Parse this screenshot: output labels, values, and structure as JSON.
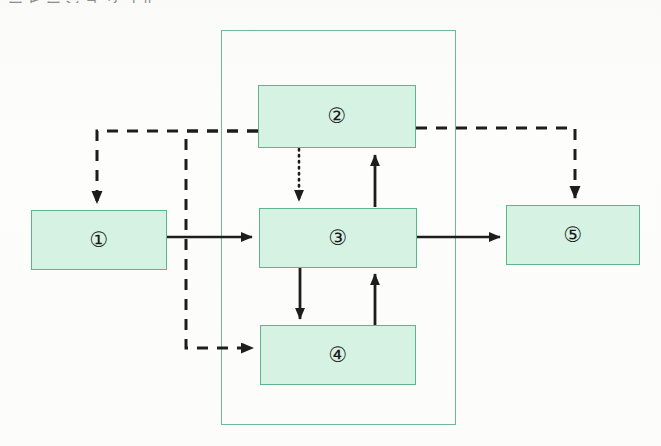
{
  "page": {
    "width": 661,
    "height": 446,
    "background_color": "#fbfbfa",
    "clipped_top_text": "ーヒージョンゴル、"
  },
  "palette": {
    "node_fill": "#d6f2e2",
    "node_border": "#5eb58c",
    "container_border": "#6fb795",
    "arrow_color": "#1d1d1d",
    "background": "#fbfbfa"
  },
  "diagram": {
    "type": "block-flow-diagram",
    "container": {
      "name": "system-boundary",
      "x": 221,
      "y": 30,
      "width": 235,
      "height": 395,
      "style": "solid-thin-green-outline",
      "fill": "none"
    },
    "nodes": [
      {
        "id": "n1",
        "label": "①",
        "number": 1,
        "x": 31,
        "y": 210,
        "width": 136,
        "height": 60
      },
      {
        "id": "n2",
        "label": "②",
        "number": 2,
        "x": 258,
        "y": 85,
        "width": 158,
        "height": 63
      },
      {
        "id": "n3",
        "label": "③",
        "number": 3,
        "x": 259,
        "y": 208,
        "width": 158,
        "height": 60
      },
      {
        "id": "n4",
        "label": "④",
        "number": 4,
        "x": 260,
        "y": 325,
        "width": 156,
        "height": 60
      },
      {
        "id": "n5",
        "label": "⑤",
        "number": 5,
        "x": 506,
        "y": 205,
        "width": 134,
        "height": 60
      }
    ],
    "edges": [
      {
        "id": "e1",
        "from": "n1",
        "to": "n3",
        "style": "solid",
        "direction": "right",
        "label": ""
      },
      {
        "id": "e2",
        "from": "n3",
        "to": "n5",
        "style": "solid",
        "direction": "right",
        "label": ""
      },
      {
        "id": "e3",
        "from": "n2",
        "to": "n3",
        "style": "dotted",
        "direction": "down",
        "label": ""
      },
      {
        "id": "e4",
        "from": "n3",
        "to": "n2",
        "style": "solid",
        "direction": "up",
        "label": ""
      },
      {
        "id": "e5",
        "from": "n3",
        "to": "n4",
        "style": "solid",
        "direction": "down",
        "label": ""
      },
      {
        "id": "e6",
        "from": "n4",
        "to": "n3",
        "style": "solid",
        "direction": "up",
        "label": ""
      },
      {
        "id": "e7",
        "from": "n2",
        "to": "n1",
        "style": "dashed",
        "direction": "left-then-down",
        "label": ""
      },
      {
        "id": "e8",
        "from": "n2",
        "to": "n4",
        "style": "dashed",
        "direction": "left-then-down-then-right",
        "label": ""
      },
      {
        "id": "e9",
        "from": "n2",
        "to": "n5",
        "style": "dashed",
        "direction": "right-then-down",
        "label": ""
      }
    ]
  }
}
